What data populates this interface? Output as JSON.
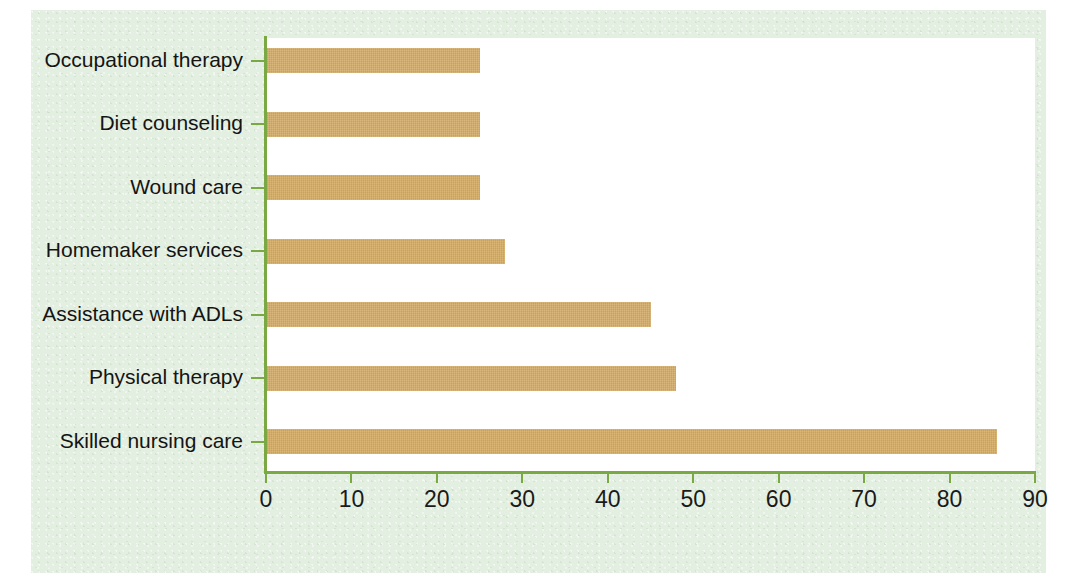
{
  "chart_data": {
    "type": "bar",
    "orientation": "horizontal",
    "title": "",
    "subtitle": "",
    "xlabel": "",
    "ylabel": "",
    "categories": [
      "Occupational therapy",
      "Diet counseling",
      "Wound care",
      "Homemaker services",
      "Assistance with ADLs",
      "Physical therapy",
      "Skilled nursing care"
    ],
    "values": [
      25,
      25,
      25,
      28,
      45,
      48,
      85.5
    ],
    "xlim": [
      0,
      90
    ],
    "xticks": [
      0,
      10,
      20,
      30,
      40,
      50,
      60,
      70,
      80,
      90
    ],
    "xtick_labels": [
      "0",
      "10",
      "20",
      "30",
      "40",
      "50",
      "60",
      "70",
      "80",
      "90"
    ],
    "grid": false,
    "legend": false,
    "bar_color": "#cfa55e",
    "axis_color": "#7aa842",
    "plot_background": "#ffffff",
    "panel_background": "#e3efe1",
    "text_color": "#141414"
  }
}
